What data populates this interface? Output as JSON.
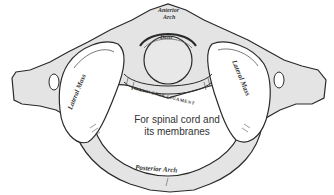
{
  "diagram": {
    "colors": {
      "bone_fill": "#e4e4e4",
      "outline": "#2a2a2a",
      "background": "#ffffff",
      "text": "#333333"
    },
    "labels": {
      "anterior_arch_line1": "Anterior",
      "anterior_arch_line2": "Arch",
      "dens": "Dens",
      "lateral_mass_left": "Lateral Mass",
      "lateral_mass_right": "Lateral Mass",
      "transverse_ligament": "TRANSVERSE LIGAMENT",
      "foramen_line1": "For spinal cord and",
      "foramen_line2": "its membranes",
      "posterior_arch": "Posterior Arch"
    }
  }
}
